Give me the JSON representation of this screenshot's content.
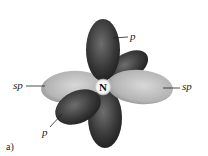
{
  "diagram": {
    "atom_label": "N",
    "caption": "a)",
    "labels": {
      "p_top": "p",
      "p_front": "p",
      "sp_left": "sp",
      "sp_right": "sp"
    },
    "colors": {
      "p_orbital_dark": "#2a2a2a",
      "p_orbital_mid": "#6a6a6a",
      "sp_orbital_light": "#d0d0d0",
      "sp_orbital_mid": "#a8a8a8",
      "nucleus_fill": "#ffffff",
      "background": "#ffffff"
    }
  }
}
